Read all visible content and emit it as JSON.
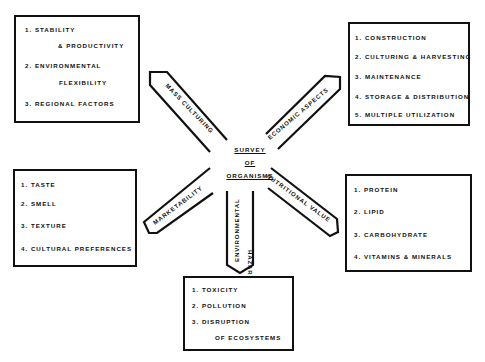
{
  "center": {
    "lines": [
      "SURVEY",
      "OF",
      "ORGANISMS"
    ]
  },
  "arrows": {
    "mass_culturing": "MASS CULTURING",
    "economic_aspects": "ECONOMIC ASPECTS",
    "marketability": "MARKETABILITY",
    "nutritional_value": "NUTRITIONAL VALUE",
    "environmental_hazards_line1": "ENVIRONMENTAL",
    "environmental_hazards_line2": "HAZARDS"
  },
  "boxes": {
    "mass_culturing": {
      "items": [
        "1. STABILITY",
        "& PRODUCTIVITY",
        "2. ENVIRONMENTAL",
        "FLEXIBILITY",
        "3. REGIONAL FACTORS"
      ]
    },
    "economic_aspects": {
      "items": [
        "1. CONSTRUCTION",
        "2. CULTURING & HARVESTING",
        "3. MAINTENANCE",
        "4. STORAGE & DISTRIBUTION",
        "5. MULTIPLE UTILIZATION"
      ]
    },
    "marketability": {
      "items": [
        "1. TASTE",
        "2. SMELL",
        "3. TEXTURE",
        "4. CULTURAL PREFERENCES"
      ]
    },
    "nutritional_value": {
      "items": [
        "1. PROTEIN",
        "2. LIPID",
        "3. CARBOHYDRATE",
        "4. VITAMINS & MINERALS"
      ]
    },
    "environmental_hazards": {
      "items": [
        "1. TOXICITY",
        "2. POLLUTION",
        "3. DISRUPTION",
        "OF ECOSYSTEMS"
      ]
    }
  }
}
